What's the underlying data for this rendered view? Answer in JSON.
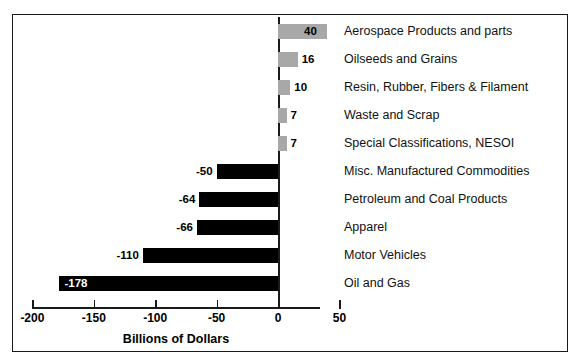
{
  "chart_data": {
    "type": "bar",
    "orientation": "horizontal",
    "title": "",
    "xlabel": "Billions of Dollars",
    "ylabel": "",
    "xlim": [
      -200,
      50
    ],
    "grid": false,
    "legend": "none",
    "tick_labels": [
      "-200",
      "-150",
      "-100",
      "-50",
      "0",
      "50"
    ],
    "ticks": [
      -200,
      -150,
      -100,
      -50,
      0,
      50
    ],
    "categories": [
      "Aerospace Products and parts",
      "Oilseeds and Grains",
      "Resin, Rubber, Fibers & Filament",
      "Waste and Scrap",
      "Special Classifications, NESOI",
      "Misc. Manufactured Commodities",
      "Petroleum and Coal Products",
      "Apparel",
      "Motor Vehicles",
      "Oil and Gas"
    ],
    "values": [
      40,
      16,
      10,
      7,
      7,
      -50,
      -64,
      -66,
      -110,
      -178
    ],
    "value_labels": [
      "40",
      "16",
      "10",
      "7",
      "7",
      "-50",
      "-64",
      "-66",
      "-110",
      "-178"
    ],
    "colors": {
      "positive": "#a8a8a8",
      "negative": "#000000",
      "axis": "#1a1a1a",
      "frame": "#1a1a1a",
      "background": "#ffffff",
      "text": "#000000"
    }
  },
  "bottom_caption": ""
}
